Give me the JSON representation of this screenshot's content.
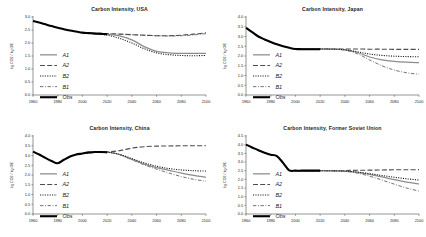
{
  "figure": {
    "background": "#ffffff",
    "layout": "2x2 grid of line charts",
    "panel_count": 4
  },
  "legend": {
    "entries": [
      {
        "key": "A1",
        "label": "A1",
        "style": "solid-gray",
        "color": "#8c8c8c",
        "width": 1.25,
        "dash": "none"
      },
      {
        "key": "A2",
        "label": "A2",
        "style": "long-dash",
        "color": "#4d4d4d",
        "width": 1.1,
        "dash": "5,2.2"
      },
      {
        "key": "B2",
        "label": "B2",
        "style": "dotted",
        "color": "#1a1a1a",
        "width": 1.1,
        "dash": "1.1,1.3"
      },
      {
        "key": "B1",
        "label": "B1",
        "style": "dash-dot",
        "color": "#5a5a5a",
        "width": 0.85,
        "dash": "3.4,1.6,0.9,1.6"
      },
      {
        "key": "Obs",
        "label": "Obs",
        "style": "thick-solid",
        "color": "#000000",
        "width": 2.1,
        "dash": "none"
      }
    ]
  },
  "chart_data": [
    {
      "type": "line",
      "title": "Carbon Intensity, USA",
      "xlabel": "",
      "ylabel": "kg CO2 / kg OE",
      "xlim": [
        1960,
        2100
      ],
      "ylim": [
        0.0,
        3.0
      ],
      "xticks": [
        1960,
        1980,
        2000,
        2020,
        2040,
        2060,
        2080,
        2100
      ],
      "yticks": [
        0.0,
        0.5,
        1.0,
        1.5,
        2.0,
        2.5,
        3.0
      ],
      "ytick_labels": [
        "0.0",
        "0.5",
        "1.0",
        "1.5",
        "2.0",
        "2.5",
        "3.0"
      ],
      "grid": false,
      "legend_position": "center-left",
      "series": [
        {
          "name": "Obs",
          "x": [
            1960,
            1965,
            1970,
            1975,
            1980,
            1985,
            1990,
            1995,
            2000,
            2005,
            2010,
            2015,
            2020
          ],
          "values": [
            2.85,
            2.79,
            2.72,
            2.65,
            2.59,
            2.53,
            2.48,
            2.44,
            2.4,
            2.38,
            2.36,
            2.35,
            2.34
          ]
        },
        {
          "name": "A1",
          "x": [
            2000,
            2010,
            2020,
            2030,
            2040,
            2050,
            2060,
            2070,
            2080,
            2090,
            2100
          ],
          "values": [
            2.4,
            2.37,
            2.33,
            2.27,
            2.12,
            1.86,
            1.68,
            1.62,
            1.6,
            1.6,
            1.6
          ]
        },
        {
          "name": "A2",
          "x": [
            2000,
            2010,
            2020,
            2030,
            2040,
            2050,
            2060,
            2070,
            2080,
            2090,
            2100
          ],
          "values": [
            2.4,
            2.38,
            2.36,
            2.34,
            2.32,
            2.3,
            2.28,
            2.28,
            2.3,
            2.34,
            2.39
          ]
        },
        {
          "name": "B2",
          "x": [
            2000,
            2010,
            2020,
            2030,
            2040,
            2050,
            2060,
            2070,
            2080,
            2090,
            2100
          ],
          "values": [
            2.4,
            2.36,
            2.3,
            2.18,
            2.0,
            1.78,
            1.62,
            1.55,
            1.52,
            1.51,
            1.52
          ]
        },
        {
          "name": "B1",
          "x": [
            2000,
            2010,
            2020,
            2030,
            2040,
            2050,
            2060,
            2070,
            2080,
            2090,
            2100
          ],
          "values": [
            2.4,
            2.38,
            2.36,
            2.34,
            2.32,
            2.3,
            2.28,
            2.27,
            2.28,
            2.31,
            2.36
          ]
        }
      ]
    },
    {
      "type": "line",
      "title": "Carbon Intensity, Japan",
      "xlabel": "",
      "ylabel": "kg CO2 / kg OE",
      "xlim": [
        1960,
        2100
      ],
      "ylim": [
        0.0,
        4.0
      ],
      "xticks": [
        1960,
        1980,
        2000,
        2020,
        2040,
        2060,
        2080,
        2100
      ],
      "yticks": [
        0.0,
        0.5,
        1.0,
        1.5,
        2.0,
        2.5,
        3.0,
        3.5,
        4.0
      ],
      "ytick_labels": [
        "0.0",
        "0.5",
        "1.0",
        "1.5",
        "2.0",
        "2.5",
        "3.0",
        "3.5",
        "4.0"
      ],
      "grid": false,
      "legend_position": "center-left",
      "series": [
        {
          "name": "Obs",
          "x": [
            1960,
            1965,
            1970,
            1975,
            1980,
            1985,
            1990,
            1995,
            2000,
            2005,
            2010,
            2015,
            2020
          ],
          "values": [
            3.45,
            3.22,
            3.0,
            2.85,
            2.72,
            2.6,
            2.5,
            2.42,
            2.36,
            2.35,
            2.35,
            2.35,
            2.35
          ]
        },
        {
          "name": "A1",
          "x": [
            2000,
            2010,
            2020,
            2030,
            2040,
            2050,
            2060,
            2070,
            2080,
            2090,
            2100
          ],
          "values": [
            2.36,
            2.36,
            2.36,
            2.35,
            2.32,
            2.18,
            1.95,
            1.8,
            1.72,
            1.68,
            1.66
          ]
        },
        {
          "name": "A2",
          "x": [
            2000,
            2010,
            2020,
            2030,
            2040,
            2050,
            2060,
            2070,
            2080,
            2090,
            2100
          ],
          "values": [
            2.36,
            2.36,
            2.36,
            2.36,
            2.36,
            2.36,
            2.35,
            2.35,
            2.34,
            2.34,
            2.34
          ]
        },
        {
          "name": "B2",
          "x": [
            2000,
            2010,
            2020,
            2030,
            2040,
            2050,
            2060,
            2070,
            2080,
            2090,
            2100
          ],
          "values": [
            2.36,
            2.36,
            2.36,
            2.35,
            2.32,
            2.22,
            2.1,
            2.03,
            1.99,
            1.97,
            1.96
          ]
        },
        {
          "name": "B1",
          "x": [
            2000,
            2010,
            2020,
            2030,
            2040,
            2050,
            2060,
            2070,
            2080,
            2090,
            2100
          ],
          "values": [
            2.36,
            2.36,
            2.36,
            2.35,
            2.3,
            2.12,
            1.8,
            1.5,
            1.28,
            1.14,
            1.06
          ]
        }
      ]
    },
    {
      "type": "line",
      "title": "Carbon Intensity, China",
      "xlabel": "",
      "ylabel": "kg CO2 / kg OE",
      "xlim": [
        1960,
        2100
      ],
      "ylim": [
        0.0,
        4.0
      ],
      "xticks": [
        1960,
        1980,
        2000,
        2020,
        2040,
        2060,
        2080,
        2100
      ],
      "yticks": [
        0.0,
        0.5,
        1.0,
        1.5,
        2.0,
        2.5,
        3.0,
        3.5,
        4.0
      ],
      "ytick_labels": [
        "0.0",
        "0.5",
        "1.0",
        "1.5",
        "2.0",
        "2.5",
        "3.0",
        "3.5",
        "4.0"
      ],
      "grid": false,
      "legend_position": "center-left",
      "series": [
        {
          "name": "Obs",
          "x": [
            1960,
            1965,
            1970,
            1975,
            1980,
            1985,
            1990,
            1995,
            2000,
            2005,
            2010,
            2015,
            2020
          ],
          "values": [
            3.2,
            3.05,
            2.88,
            2.72,
            2.6,
            2.78,
            2.95,
            3.05,
            3.1,
            3.16,
            3.18,
            3.18,
            3.16
          ]
        },
        {
          "name": "A1",
          "x": [
            2000,
            2010,
            2020,
            2030,
            2040,
            2050,
            2060,
            2070,
            2080,
            2090,
            2100
          ],
          "values": [
            3.1,
            3.16,
            3.17,
            3.05,
            2.8,
            2.56,
            2.38,
            2.24,
            2.1,
            1.98,
            1.88
          ]
        },
        {
          "name": "A2",
          "x": [
            2000,
            2010,
            2020,
            2030,
            2040,
            2050,
            2060,
            2070,
            2080,
            2090,
            2100
          ],
          "values": [
            3.1,
            3.16,
            3.18,
            3.25,
            3.38,
            3.45,
            3.48,
            3.49,
            3.5,
            3.5,
            3.5
          ]
        },
        {
          "name": "B2",
          "x": [
            2000,
            2010,
            2020,
            2030,
            2040,
            2050,
            2060,
            2070,
            2080,
            2090,
            2100
          ],
          "values": [
            3.1,
            3.16,
            3.17,
            3.06,
            2.84,
            2.62,
            2.45,
            2.33,
            2.26,
            2.22,
            2.2
          ]
        },
        {
          "name": "B1",
          "x": [
            2000,
            2010,
            2020,
            2030,
            2040,
            2050,
            2060,
            2070,
            2080,
            2090,
            2100
          ],
          "values": [
            3.1,
            3.16,
            3.17,
            3.04,
            2.78,
            2.52,
            2.3,
            2.1,
            1.92,
            1.78,
            1.68
          ]
        }
      ]
    },
    {
      "type": "line",
      "title": "Carbon Intensity, Former Soviet Union",
      "xlabel": "",
      "ylabel": "kg CO2 / kg OE",
      "xlim": [
        1960,
        2100
      ],
      "ylim": [
        0.0,
        4.5
      ],
      "xticks": [
        1960,
        1980,
        2000,
        2020,
        2040,
        2060,
        2080,
        2100
      ],
      "yticks": [
        0.0,
        0.5,
        1.0,
        1.5,
        2.0,
        2.5,
        3.0,
        3.5,
        4.0,
        4.5
      ],
      "ytick_labels": [
        "0.0",
        "0.5",
        "1.0",
        "1.5",
        "2.0",
        "2.5",
        "3.0",
        "3.5",
        "4.0",
        "4.5"
      ],
      "grid": false,
      "legend_position": "center-left",
      "series": [
        {
          "name": "Obs",
          "x": [
            1960,
            1965,
            1970,
            1975,
            1980,
            1985,
            1990,
            1995,
            2000,
            2005,
            2010,
            2015,
            2020
          ],
          "values": [
            4.0,
            3.84,
            3.68,
            3.54,
            3.42,
            3.34,
            2.95,
            2.52,
            2.5,
            2.5,
            2.5,
            2.5,
            2.5
          ]
        },
        {
          "name": "A1",
          "x": [
            2000,
            2010,
            2020,
            2030,
            2040,
            2050,
            2060,
            2070,
            2080,
            2090,
            2100
          ],
          "values": [
            2.5,
            2.5,
            2.5,
            2.49,
            2.47,
            2.4,
            2.28,
            2.14,
            1.98,
            1.84,
            1.74
          ]
        },
        {
          "name": "A2",
          "x": [
            2000,
            2010,
            2020,
            2030,
            2040,
            2050,
            2060,
            2070,
            2080,
            2090,
            2100
          ],
          "values": [
            2.5,
            2.5,
            2.5,
            2.5,
            2.51,
            2.52,
            2.53,
            2.54,
            2.55,
            2.55,
            2.56
          ]
        },
        {
          "name": "B2",
          "x": [
            2000,
            2010,
            2020,
            2030,
            2040,
            2050,
            2060,
            2070,
            2080,
            2090,
            2100
          ],
          "values": [
            2.5,
            2.5,
            2.5,
            2.49,
            2.47,
            2.42,
            2.33,
            2.22,
            2.12,
            2.03,
            1.96
          ]
        },
        {
          "name": "B1",
          "x": [
            2000,
            2010,
            2020,
            2030,
            2040,
            2050,
            2060,
            2070,
            2080,
            2090,
            2100
          ],
          "values": [
            2.5,
            2.5,
            2.5,
            2.49,
            2.46,
            2.36,
            2.18,
            1.96,
            1.72,
            1.5,
            1.32
          ]
        }
      ]
    }
  ]
}
